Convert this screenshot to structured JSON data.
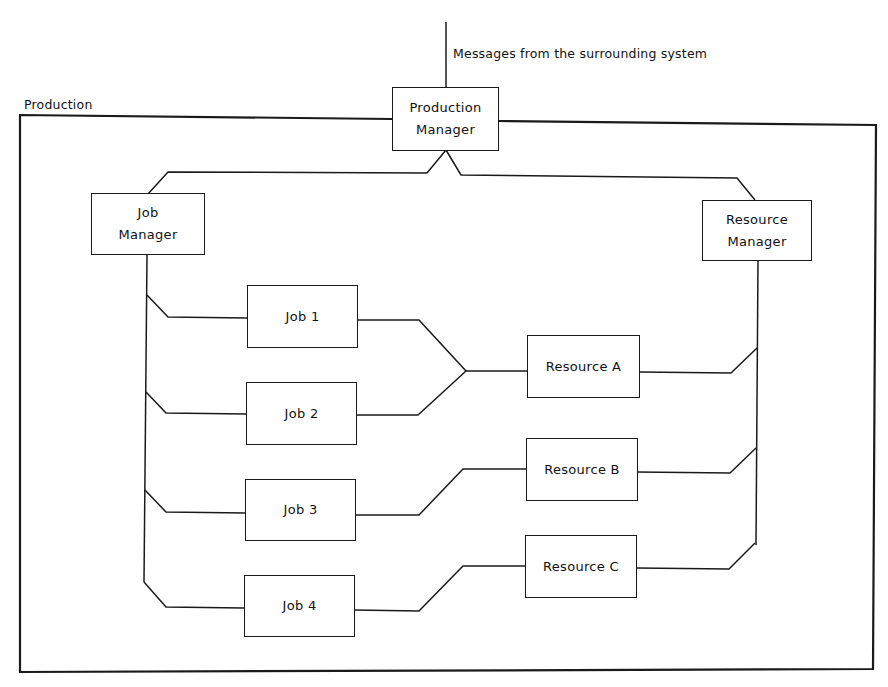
{
  "diagram": {
    "external_input_label": "Messages from the surrounding system",
    "container_label": "Production",
    "nodes": {
      "production_manager": {
        "line1": "Production",
        "line2": "Manager"
      },
      "job_manager": {
        "line1": "Job",
        "line2": "Manager"
      },
      "resource_manager": {
        "line1": "Resource",
        "line2": "Manager"
      },
      "job1": "Job 1",
      "job2": "Job 2",
      "job3": "Job 3",
      "job4": "Job 4",
      "resource_a": "Resource A",
      "resource_b": "Resource B",
      "resource_c": "Resource C"
    },
    "edges": [
      [
        "Surrounding system",
        "Production Manager"
      ],
      [
        "Production Manager",
        "Job Manager"
      ],
      [
        "Production Manager",
        "Resource Manager"
      ],
      [
        "Job Manager",
        "Job 1"
      ],
      [
        "Job Manager",
        "Job 2"
      ],
      [
        "Job Manager",
        "Job 3"
      ],
      [
        "Job Manager",
        "Job 4"
      ],
      [
        "Resource Manager",
        "Resource A"
      ],
      [
        "Resource Manager",
        "Resource B"
      ],
      [
        "Resource Manager",
        "Resource C"
      ],
      [
        "Job 1",
        "Resource A"
      ],
      [
        "Job 2",
        "Resource A"
      ],
      [
        "Job 3",
        "Resource B"
      ],
      [
        "Job 4",
        "Resource C"
      ]
    ]
  }
}
